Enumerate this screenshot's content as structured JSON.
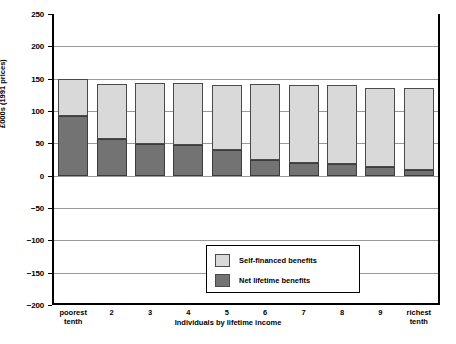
{
  "chart_data": {
    "type": "bar",
    "stacked": true,
    "title": "",
    "xlabel": "Individuals by lifetime income",
    "ylabel": "£000s (1991 prices)",
    "ylim": [
      -200,
      250
    ],
    "yticks": [
      250,
      200,
      150,
      100,
      50,
      0,
      -50,
      -100,
      -150,
      -200
    ],
    "ytick_labels": [
      "250",
      "200",
      "150",
      "100",
      "50",
      "0",
      "−50",
      "−100",
      "−150",
      "−200"
    ],
    "grid": true,
    "legend_position": "inside-bottom-center",
    "categories": [
      "poorest tenth",
      "2",
      "3",
      "4",
      "5",
      "6",
      "7",
      "8",
      "9",
      "richest tenth"
    ],
    "category_lines": [
      [
        "poorest",
        "tenth"
      ],
      [
        "2"
      ],
      [
        "3"
      ],
      [
        "4"
      ],
      [
        "5"
      ],
      [
        "6"
      ],
      [
        "7"
      ],
      [
        "8"
      ],
      [
        "9"
      ],
      [
        "richest",
        "tenth"
      ]
    ],
    "series": [
      {
        "name": "Net lifetime benefits",
        "color": "#737373",
        "values": [
          93,
          57,
          49,
          47,
          40,
          24,
          19,
          18,
          13,
          9
        ]
      },
      {
        "name": "Self-financed benefits",
        "color": "#d9d9d9",
        "values": [
          57,
          85,
          95,
          96,
          100,
          117,
          121,
          122,
          123,
          126
        ]
      }
    ],
    "totals": [
      150,
      142,
      144,
      143,
      140,
      141,
      140,
      140,
      136,
      135
    ]
  },
  "legend": {
    "items": [
      {
        "label": "Self-financed benefits",
        "color": "#d9d9d9"
      },
      {
        "label": "Net lifetime benefits",
        "color": "#737373"
      }
    ]
  }
}
